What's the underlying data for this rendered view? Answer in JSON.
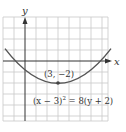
{
  "figure": {
    "type": "parabola-graph",
    "axes": {
      "x_label": "x",
      "y_label": "y"
    },
    "grid": {
      "x_min": -2,
      "x_max": 7.5,
      "y_min": -5.5,
      "y_max": 4,
      "step": 1
    },
    "curve": {
      "equation_label": "(x − 3)² = 8(y + 2)",
      "equation_lhs": "(x − 3)",
      "equation_exp": "2",
      "equation_rhs": " = 8(y + 2)",
      "vertex": {
        "x": 3,
        "y": -2
      },
      "p": 2,
      "x_range": [
        -2,
        8
      ]
    },
    "vertex_label": "(3, −2)",
    "colors": {
      "grid": "#c8c8c8",
      "axes": "#333333",
      "curve": "#555555",
      "point": "#444444"
    }
  }
}
